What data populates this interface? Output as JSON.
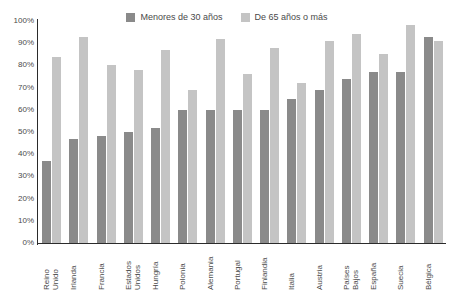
{
  "chart_data": {
    "type": "bar",
    "title": "",
    "xlabel": "",
    "ylabel": "",
    "ylim": [
      0,
      100
    ],
    "y_tick_labels": [
      "100%",
      "90%",
      "80%",
      "70%",
      "60%",
      "50%",
      "40%",
      "30%",
      "20%",
      "10%",
      "0%"
    ],
    "y_tick_values": [
      100,
      90,
      80,
      70,
      60,
      50,
      40,
      30,
      20,
      10,
      0
    ],
    "grid": false,
    "legend_position": "top-center",
    "categories": [
      "Reino\nUnido",
      "Irlanda",
      "Francia",
      "Estados\nUnidos",
      "Hungría",
      "Polonia",
      "Alemania",
      "Portugal",
      "Finlandia",
      "Italia",
      "Austria",
      "Países\nBajos",
      "España",
      "Suecia",
      "Bélgica"
    ],
    "series": [
      {
        "name": "Menores de 30 años",
        "color": "#8a8a8a",
        "values": [
          37,
          47,
          48,
          50,
          52,
          60,
          60,
          60,
          60,
          65,
          69,
          74,
          77,
          77,
          93
        ]
      },
      {
        "name": "De 65 años o más",
        "color": "#c4c4c4",
        "values": [
          84,
          93,
          80,
          78,
          87,
          69,
          92,
          76,
          88,
          72,
          91,
          94,
          85,
          98,
          91
        ]
      }
    ]
  },
  "legend": {
    "entries": [
      {
        "label": "Menores de 30 años",
        "color": "#8a8a8a"
      },
      {
        "label": "De 65 años o más",
        "color": "#c4c4c4"
      }
    ]
  },
  "axis": {
    "y_line_color": "#2b2b2b",
    "x_line_color": "#2b2b2b"
  }
}
